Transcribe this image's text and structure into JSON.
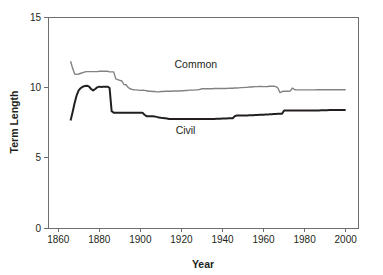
{
  "chart_data": {
    "type": "line",
    "title": "",
    "xlabel": "Year",
    "ylabel": "Term Length",
    "xlim": [
      1855,
      2006
    ],
    "ylim": [
      0,
      15
    ],
    "xticks": [
      1860,
      1880,
      1900,
      1920,
      1940,
      1960,
      1980,
      2000
    ],
    "xtick_labels": [
      "1860",
      "1880",
      "1900",
      "1920",
      "1940",
      "1960",
      "1980",
      "2000"
    ],
    "yticks": [
      0,
      5,
      10,
      15
    ],
    "ytick_labels": [
      "0",
      "5",
      "10",
      "15"
    ],
    "grid": false,
    "legend_position": "inline-annotation",
    "series": [
      {
        "name": "Common",
        "color": "#808285",
        "label_x": 1927,
        "label_y": 11.35,
        "x": [
          1866,
          1867,
          1868,
          1869,
          1870,
          1871,
          1872,
          1873,
          1874,
          1875,
          1876,
          1877,
          1878,
          1879,
          1880,
          1881,
          1882,
          1883,
          1884,
          1885,
          1886,
          1887,
          1888,
          1889,
          1890,
          1891,
          1892,
          1893,
          1894,
          1895,
          1896,
          1897,
          1898,
          1899,
          1900,
          1901,
          1902,
          1903,
          1904,
          1905,
          1906,
          1907,
          1908,
          1909,
          1910,
          1911,
          1912,
          1913,
          1914,
          1915,
          1916,
          1917,
          1918,
          1919,
          1920,
          1921,
          1922,
          1923,
          1924,
          1925,
          1926,
          1927,
          1928,
          1929,
          1930,
          1931,
          1932,
          1933,
          1934,
          1935,
          1936,
          1937,
          1938,
          1939,
          1940,
          1941,
          1942,
          1943,
          1944,
          1945,
          1946,
          1947,
          1948,
          1949,
          1950,
          1951,
          1952,
          1953,
          1954,
          1955,
          1956,
          1957,
          1958,
          1959,
          1960,
          1961,
          1962,
          1963,
          1964,
          1965,
          1966,
          1967,
          1968,
          1969,
          1970,
          1971,
          1972,
          1973,
          1974,
          1975,
          1976,
          1977,
          1978,
          1979,
          1980,
          1981,
          1982,
          1983,
          1984,
          1985,
          1986,
          1987,
          1988,
          1989,
          1990,
          1991,
          1992,
          1993,
          1994,
          1995,
          1996,
          1997,
          1998,
          1999,
          2000
        ],
        "y": [
          11.85,
          11.35,
          10.95,
          10.92,
          10.95,
          11.0,
          11.05,
          11.1,
          11.12,
          11.12,
          11.12,
          11.12,
          11.12,
          11.12,
          11.14,
          11.14,
          11.14,
          11.14,
          11.14,
          11.1,
          11.1,
          11.1,
          10.6,
          10.55,
          10.5,
          10.45,
          10.2,
          10.18,
          10.0,
          9.9,
          9.85,
          9.83,
          9.82,
          9.8,
          9.78,
          9.8,
          9.78,
          9.76,
          9.72,
          9.72,
          9.7,
          9.7,
          9.68,
          9.68,
          9.7,
          9.7,
          9.72,
          9.72,
          9.72,
          9.72,
          9.74,
          9.74,
          9.74,
          9.74,
          9.76,
          9.76,
          9.78,
          9.78,
          9.8,
          9.8,
          9.8,
          9.82,
          9.82,
          9.86,
          9.9,
          9.9,
          9.9,
          9.9,
          9.9,
          9.9,
          9.92,
          9.92,
          9.92,
          9.92,
          9.92,
          9.92,
          9.92,
          9.94,
          9.94,
          9.94,
          9.95,
          9.95,
          9.96,
          9.98,
          9.98,
          10.0,
          10.0,
          10.02,
          10.02,
          10.04,
          10.05,
          10.05,
          10.06,
          10.06,
          10.05,
          10.05,
          10.06,
          10.08,
          10.08,
          10.08,
          10.05,
          9.95,
          9.62,
          9.7,
          9.72,
          9.72,
          9.72,
          9.73,
          9.95,
          9.85,
          9.82,
          9.82,
          9.82,
          9.82,
          9.82,
          9.82,
          9.82,
          9.82,
          9.82,
          9.82,
          9.83,
          9.83,
          9.83,
          9.83,
          9.83,
          9.83,
          9.83,
          9.83,
          9.83,
          9.83,
          9.83,
          9.83,
          9.83,
          9.83,
          9.83
        ]
      },
      {
        "name": "Civil",
        "color": "#231f20",
        "label_x": 1922,
        "label_y": 6.7,
        "x": [
          1866,
          1867,
          1868,
          1869,
          1870,
          1871,
          1872,
          1873,
          1874,
          1875,
          1876,
          1877,
          1878,
          1879,
          1880,
          1881,
          1882,
          1883,
          1884,
          1885,
          1886,
          1887,
          1888,
          1889,
          1890,
          1891,
          1892,
          1893,
          1894,
          1895,
          1896,
          1897,
          1898,
          1899,
          1900,
          1901,
          1902,
          1903,
          1904,
          1905,
          1906,
          1907,
          1908,
          1909,
          1910,
          1911,
          1912,
          1913,
          1914,
          1915,
          1916,
          1917,
          1918,
          1919,
          1920,
          1921,
          1922,
          1923,
          1924,
          1925,
          1926,
          1927,
          1928,
          1929,
          1930,
          1931,
          1932,
          1933,
          1934,
          1935,
          1936,
          1937,
          1938,
          1939,
          1940,
          1941,
          1942,
          1943,
          1944,
          1945,
          1946,
          1947,
          1948,
          1949,
          1950,
          1951,
          1952,
          1953,
          1954,
          1955,
          1956,
          1957,
          1958,
          1959,
          1960,
          1961,
          1962,
          1963,
          1964,
          1965,
          1966,
          1967,
          1968,
          1969,
          1970,
          1971,
          1972,
          1973,
          1974,
          1975,
          1976,
          1977,
          1978,
          1979,
          1980,
          1981,
          1982,
          1983,
          1984,
          1985,
          1986,
          1987,
          1988,
          1989,
          1990,
          1991,
          1992,
          1993,
          1994,
          1995,
          1996,
          1997,
          1998,
          1999,
          2000
        ],
        "y": [
          7.65,
          8.25,
          8.9,
          9.45,
          9.8,
          9.95,
          10.05,
          10.1,
          10.12,
          10.05,
          9.88,
          9.78,
          9.88,
          10.0,
          10.05,
          10.02,
          10.05,
          10.05,
          10.05,
          9.95,
          8.3,
          8.2,
          8.2,
          8.2,
          8.2,
          8.2,
          8.2,
          8.2,
          8.2,
          8.2,
          8.2,
          8.2,
          8.2,
          8.2,
          8.2,
          8.2,
          8.05,
          7.95,
          7.95,
          7.95,
          7.95,
          7.92,
          7.9,
          7.85,
          7.83,
          7.82,
          7.8,
          7.78,
          7.75,
          7.75,
          7.75,
          7.75,
          7.75,
          7.75,
          7.75,
          7.75,
          7.75,
          7.75,
          7.75,
          7.75,
          7.75,
          7.75,
          7.75,
          7.75,
          7.75,
          7.75,
          7.75,
          7.75,
          7.75,
          7.75,
          7.75,
          7.76,
          7.76,
          7.76,
          7.78,
          7.78,
          7.78,
          7.8,
          7.8,
          7.8,
          7.95,
          8.0,
          8.0,
          8.0,
          8.0,
          8.0,
          8.0,
          8.02,
          8.02,
          8.02,
          8.04,
          8.04,
          8.05,
          8.05,
          8.05,
          8.06,
          8.06,
          8.08,
          8.08,
          8.1,
          8.1,
          8.12,
          8.12,
          8.12,
          8.35,
          8.35,
          8.35,
          8.35,
          8.35,
          8.35,
          8.35,
          8.35,
          8.35,
          8.35,
          8.35,
          8.36,
          8.36,
          8.36,
          8.36,
          8.36,
          8.36,
          8.36,
          8.37,
          8.37,
          8.37,
          8.37,
          8.38,
          8.38,
          8.38,
          8.38,
          8.38,
          8.38,
          8.38,
          8.38,
          8.38
        ]
      }
    ]
  },
  "colors": {
    "common_series": "#808285",
    "civil_series": "#231f20",
    "axis": "#6d6e71",
    "text": "#231f20",
    "background": "#ffffff"
  }
}
